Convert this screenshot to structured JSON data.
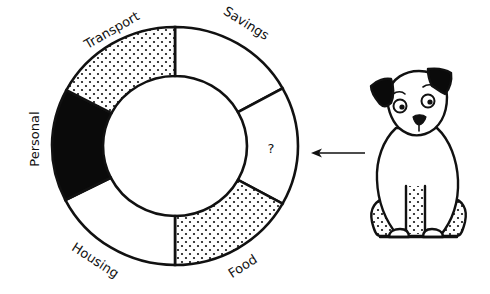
{
  "chart_data": {
    "type": "pie",
    "style": "donut",
    "title": "",
    "center": [
      175,
      146
    ],
    "outer_radius": [
      123,
      119
    ],
    "inner_radius": [
      72,
      70
    ],
    "segments": [
      {
        "label": "Savings",
        "start_deg": 0,
        "end_deg": 61,
        "fill": "white",
        "value_deg": 61
      },
      {
        "label": "?",
        "start_deg": 61,
        "end_deg": 119,
        "fill": "white",
        "value_deg": 58
      },
      {
        "label": "Food",
        "start_deg": 119,
        "end_deg": 180,
        "fill": "dotted",
        "value_deg": 61
      },
      {
        "label": "Housing",
        "start_deg": 180,
        "end_deg": 243,
        "fill": "white",
        "value_deg": 63
      },
      {
        "label": "Personal",
        "start_deg": 243,
        "end_deg": 298,
        "fill": "black",
        "value_deg": 55
      },
      {
        "label": "Transport",
        "start_deg": 298,
        "end_deg": 360,
        "fill": "dotted",
        "value_deg": 62
      }
    ]
  },
  "labels": {
    "savings": "Savings",
    "unknown": "?",
    "food": "Food",
    "housing": "Housing",
    "personal": "Personal",
    "transport": "Transport"
  },
  "colors": {
    "stroke": "#111111",
    "black_fill": "#0a0a0a",
    "background": "#ffffff"
  }
}
